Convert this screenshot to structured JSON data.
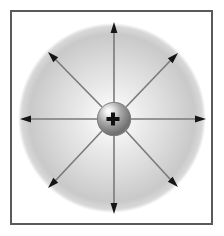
{
  "figure": {
    "title": "Electric field of a positive point charge",
    "background_color": "#ffffff",
    "width": 224,
    "height": 236
  },
  "frame": {
    "name": "figure-border",
    "left": 10,
    "top": 10,
    "width": 203,
    "height": 215,
    "stroke_color": "#5a5a5a",
    "stroke_width": 2,
    "fill_color": "#ffffff"
  },
  "field_cloud": {
    "label": "electric field region",
    "center_x": 112,
    "center_y": 118,
    "radius_x": 94,
    "radius_y": 95,
    "inner_color": "#ffffff",
    "mid_color": "#e0e0e0",
    "edge_color": "#bdbdbd",
    "outer_color": "#ffffff"
  },
  "charge": {
    "sign_label": "+",
    "polarity": "positive",
    "center_x": 114,
    "center_y": 119,
    "radius": 17,
    "highlight_color": "#f2f2f2",
    "body_color": "#9a9a9a",
    "shade_color": "#6e6e6e",
    "rim_color": "#787878",
    "sign_color": "#111111",
    "sign_thickness": 4,
    "sign_size": 13
  },
  "field_lines": {
    "count": 8,
    "stroke_color": "#7a7a7a",
    "stroke_width": 1.6,
    "arrow_color": "#151515",
    "arrow_length": 11,
    "arrow_half_width": 3.4,
    "start_radius": 17,
    "arrows": [
      {
        "name": "arrow-up",
        "angle_deg": 270,
        "tip_x": 114,
        "tip_y": 22
      },
      {
        "name": "arrow-up-right",
        "angle_deg": 315,
        "tip_x": 178,
        "tip_y": 53
      },
      {
        "name": "arrow-right",
        "angle_deg": 0,
        "tip_x": 206,
        "tip_y": 119
      },
      {
        "name": "arrow-down-right",
        "angle_deg": 45,
        "tip_x": 178,
        "tip_y": 187
      },
      {
        "name": "arrow-down",
        "angle_deg": 90,
        "tip_x": 114,
        "tip_y": 214
      },
      {
        "name": "arrow-down-left",
        "angle_deg": 135,
        "tip_x": 48,
        "tip_y": 188
      },
      {
        "name": "arrow-left",
        "angle_deg": 180,
        "tip_x": 20,
        "tip_y": 119
      },
      {
        "name": "arrow-up-left",
        "angle_deg": 225,
        "tip_x": 48,
        "tip_y": 52
      }
    ]
  }
}
